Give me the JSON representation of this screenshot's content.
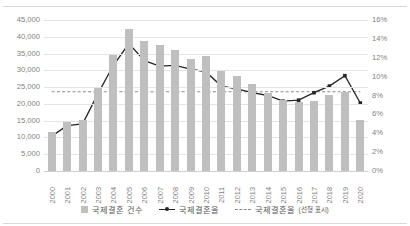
{
  "chart_data": {
    "type": "bar",
    "title": "",
    "xlabel": "",
    "ylabel": "",
    "grid": true,
    "legend_position": "bottom",
    "categories": [
      "2000",
      "2001",
      "2002",
      "2003",
      "2004",
      "2005",
      "2006",
      "2007",
      "2008",
      "2009",
      "2010",
      "2011",
      "2012",
      "2013",
      "2014",
      "2015",
      "2016",
      "2017",
      "2018",
      "2019",
      "2020"
    ],
    "axes": {
      "left": {
        "label": "",
        "ylim": [
          0,
          45000
        ],
        "ticks": [
          0,
          5000,
          10000,
          15000,
          20000,
          25000,
          30000,
          35000,
          40000,
          45000
        ],
        "tick_labels": [
          "0",
          "5,000",
          "10,000",
          "15,000",
          "20,000",
          "25,000",
          "30,000",
          "35,000",
          "40,000",
          "45,000"
        ]
      },
      "right": {
        "label": "",
        "ylim": [
          0,
          16
        ],
        "ticks": [
          0,
          2,
          4,
          6,
          8,
          10,
          12,
          14,
          16
        ],
        "tick_labels": [
          "0%",
          "2%",
          "4%",
          "6%",
          "8%",
          "10%",
          "12%",
          "14%",
          "16%"
        ]
      }
    },
    "series": [
      {
        "name": "국제결혼 건수",
        "type": "bar",
        "axis": "left",
        "color": "#bfbfbf",
        "values": [
          11605,
          14523,
          15202,
          24776,
          34640,
          42356,
          38759,
          37560,
          36204,
          33300,
          34235,
          29762,
          28325,
          25963,
          23316,
          21274,
          20591,
          20835,
          22698,
          23643,
          15341
        ]
      },
      {
        "name": "국제결혼율",
        "type": "line",
        "axis": "right",
        "color": "#262626",
        "values": [
          3.7,
          4.8,
          5.0,
          8.2,
          11.2,
          13.5,
          11.7,
          11.1,
          11.2,
          10.8,
          10.5,
          9.0,
          8.7,
          8.3,
          8.0,
          7.4,
          7.5,
          8.3,
          9.0,
          10.1,
          7.2
        ]
      },
      {
        "name": "국제결혼율(선형 표시)",
        "type": "line",
        "style": "dashed",
        "axis": "right",
        "color": "#8c8c8c",
        "values": [
          8.4,
          8.4,
          8.4,
          8.4,
          8.4,
          8.4,
          8.4,
          8.4,
          8.4,
          8.4,
          8.4,
          8.4,
          8.4,
          8.4,
          8.4,
          8.4,
          8.4,
          8.4,
          8.4,
          8.4,
          8.4
        ]
      }
    ]
  },
  "legend": {
    "items": [
      {
        "label": "국제결혼 건수"
      },
      {
        "label": "국제결혼율"
      },
      {
        "label": "국제결혼율",
        "suffix": "(선형 표시)"
      }
    ]
  }
}
